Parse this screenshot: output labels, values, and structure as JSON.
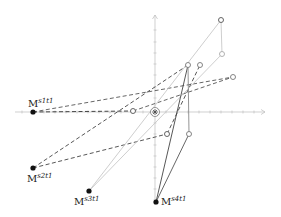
{
  "diagram": {
    "type": "vector-plot",
    "origin": {
      "x": 155,
      "y": 112,
      "marker": "star-in-circle"
    },
    "axes": {
      "x": {
        "from": 15,
        "to": 265,
        "y": 112,
        "ticks": [
          22,
          33,
          44,
          55,
          66,
          77,
          88,
          99,
          110,
          121,
          132,
          143,
          166,
          177,
          188,
          199,
          210,
          221,
          232,
          243,
          254
        ]
      },
      "y": {
        "from": 205,
        "to": 15,
        "x": 155,
        "ticks": [
          30,
          42,
          53,
          64,
          75,
          87,
          98,
          123,
          134,
          145,
          156,
          167,
          178,
          189,
          200
        ]
      }
    },
    "points": [
      {
        "id": "m1",
        "label": "M",
        "sup_s": "s",
        "sub_s": "1",
        "sup_t": "t",
        "sub_t": "1",
        "x": 33,
        "y": 112,
        "label_x": 28,
        "label_y": 98
      },
      {
        "id": "m2",
        "label": "M",
        "sup_s": "s",
        "sub_s": "2",
        "sup_t": "t",
        "sub_t": "1",
        "x": 33,
        "y": 168,
        "label_x": 27,
        "label_y": 173
      },
      {
        "id": "m3",
        "label": "M",
        "sup_s": "s",
        "sub_s": "3",
        "sup_t": "t",
        "sub_t": "1",
        "x": 89,
        "y": 191,
        "label_x": 74,
        "label_y": 196
      },
      {
        "id": "m4",
        "label": "M",
        "sup_s": "s",
        "sub_s": "4",
        "sup_t": "t",
        "sub_t": "1",
        "x": 156,
        "y": 202,
        "label_x": 161,
        "label_y": 196
      }
    ],
    "open_points": [
      {
        "id": "a",
        "x": 221,
        "y": 20,
        "tone": "dark"
      },
      {
        "id": "b",
        "x": 222,
        "y": 54,
        "tone": "light"
      },
      {
        "id": "c",
        "x": 188,
        "y": 65,
        "tone": "gray"
      },
      {
        "id": "d",
        "x": 200,
        "y": 65,
        "tone": "gray"
      },
      {
        "id": "e",
        "x": 233,
        "y": 77,
        "tone": "gray"
      },
      {
        "id": "f",
        "x": 133,
        "y": 111,
        "tone": "dark"
      },
      {
        "id": "g",
        "x": 167,
        "y": 134,
        "tone": "dark"
      },
      {
        "id": "h",
        "x": 189,
        "y": 134,
        "tone": "gray"
      }
    ],
    "segments": [
      {
        "x1": 33,
        "y1": 112,
        "x2": 133,
        "y2": 111,
        "style": "dashed",
        "color": "#333333"
      },
      {
        "x1": 33,
        "y1": 112,
        "x2": 233,
        "y2": 77,
        "style": "dashed",
        "color": "#555555"
      },
      {
        "x1": 133,
        "y1": 111,
        "x2": 233,
        "y2": 77,
        "style": "dashed",
        "color": "#555555"
      },
      {
        "x1": 33,
        "y1": 168,
        "x2": 188,
        "y2": 65,
        "style": "dashed",
        "color": "#444444"
      },
      {
        "x1": 33,
        "y1": 168,
        "x2": 167,
        "y2": 134,
        "style": "dashed",
        "color": "#444444"
      },
      {
        "x1": 167,
        "y1": 134,
        "x2": 200,
        "y2": 65,
        "style": "dashed",
        "color": "#444444"
      },
      {
        "x1": 89,
        "y1": 191,
        "x2": 221,
        "y2": 20,
        "style": "solid",
        "color": "#c8c8c8"
      },
      {
        "x1": 89,
        "y1": 191,
        "x2": 222,
        "y2": 54,
        "style": "solid",
        "color": "#c8c8c8"
      },
      {
        "x1": 221,
        "y1": 20,
        "x2": 222,
        "y2": 54,
        "style": "solid",
        "color": "#c8c8c8"
      },
      {
        "x1": 156,
        "y1": 202,
        "x2": 188,
        "y2": 65,
        "style": "solid",
        "color": "#444444"
      },
      {
        "x1": 156,
        "y1": 202,
        "x2": 189,
        "y2": 134,
        "style": "solid",
        "color": "#555555"
      },
      {
        "x1": 188,
        "y1": 65,
        "x2": 189,
        "y2": 134,
        "style": "solid",
        "color": "#888888"
      }
    ]
  }
}
